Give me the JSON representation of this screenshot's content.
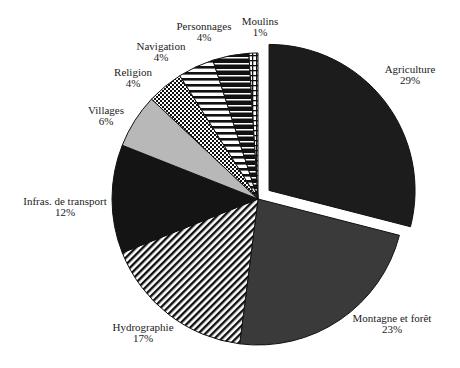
{
  "chart_data": {
    "type": "pie",
    "title": "",
    "start_angle_deg": 0,
    "direction": "clockwise",
    "exploded": [
      "Agriculture"
    ],
    "slices": [
      {
        "label": "Agriculture",
        "pct_label": "29%",
        "value": 29,
        "fill": "solid",
        "color": "#1c1c1c"
      },
      {
        "label": "Montagne et forêt",
        "pct_label": "23%",
        "value": 23,
        "fill": "solid",
        "color": "#3a3a3a"
      },
      {
        "label": "Hydrographie",
        "pct_label": "17%",
        "value": 17,
        "fill": "diagonal-stripes",
        "color": "#111111"
      },
      {
        "label": "Infras. de transport",
        "pct_label": "12%",
        "value": 12,
        "fill": "solid",
        "color": "#141414"
      },
      {
        "label": "Villages",
        "pct_label": "6%",
        "value": 6,
        "fill": "solid",
        "color": "#b8b8b8"
      },
      {
        "label": "Religion",
        "pct_label": "4%",
        "value": 4,
        "fill": "checker",
        "color": "#111111"
      },
      {
        "label": "Navigation",
        "pct_label": "4%",
        "value": 4,
        "fill": "horizontal-stripes-light",
        "color": "#111111"
      },
      {
        "label": "Personnages",
        "pct_label": "4%",
        "value": 4,
        "fill": "horizontal-stripes-dark",
        "color": "#111111"
      },
      {
        "label": "Moulins",
        "pct_label": "1%",
        "value": 1,
        "fill": "grid",
        "color": "#111111"
      }
    ],
    "legend": "none (labels placed outside slices)"
  }
}
